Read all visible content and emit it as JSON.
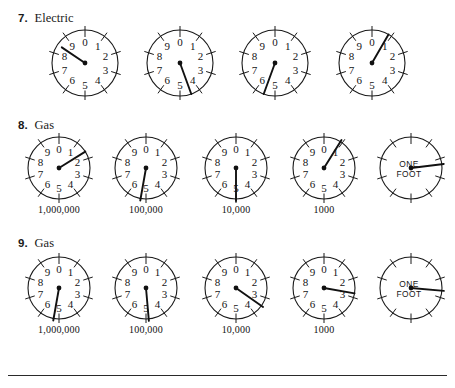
{
  "page": {
    "width": 455,
    "height": 388,
    "background": "#ffffff",
    "ink": "#1a1a1a"
  },
  "sections": [
    {
      "number": "7.",
      "label": "Electric",
      "head_x": 18,
      "head_y": 12,
      "row_top": 26,
      "dial_radius": 33,
      "show_captions": false,
      "has_one_foot": false,
      "dials": [
        {
          "name": "electric-dial-1",
          "cx": 85,
          "direction": "ccw",
          "digits": [
            "0",
            "9",
            "8",
            "7",
            "6",
            "5",
            "4",
            "3",
            "2",
            "1"
          ],
          "needle_angle": -56,
          "needle_len": 28,
          "caption": ""
        },
        {
          "name": "electric-dial-2",
          "cx": 180,
          "direction": "cw",
          "digits": [
            "0",
            "1",
            "2",
            "3",
            "4",
            "5",
            "6",
            "7",
            "8",
            "9"
          ],
          "needle_angle": 160,
          "needle_len": 33,
          "caption": ""
        },
        {
          "name": "electric-dial-3",
          "cx": 275,
          "direction": "ccw",
          "digits": [
            "0",
            "9",
            "8",
            "7",
            "6",
            "5",
            "4",
            "3",
            "2",
            "1"
          ],
          "needle_angle": -160,
          "needle_len": 33,
          "caption": ""
        },
        {
          "name": "electric-dial-4",
          "cx": 372,
          "direction": "cw",
          "digits": [
            "0",
            "1",
            "2",
            "3",
            "4",
            "5",
            "6",
            "7",
            "8",
            "9"
          ],
          "needle_angle": 30,
          "needle_len": 33,
          "caption": ""
        }
      ]
    },
    {
      "number": "8.",
      "label": "Gas",
      "head_x": 18,
      "head_y": 119,
      "row_top": 133,
      "dial_radius": 31,
      "show_captions": true,
      "has_one_foot": true,
      "dials": [
        {
          "name": "gas8-dial-1000000",
          "cx": 59,
          "direction": "ccw",
          "digits": [
            "0",
            "9",
            "8",
            "7",
            "6",
            "5",
            "4",
            "3",
            "2",
            "1"
          ],
          "needle_angle": 58,
          "needle_len": 31,
          "caption": "1,000,000"
        },
        {
          "name": "gas8-dial-100000",
          "cx": 146,
          "direction": "cw",
          "digits": [
            "0",
            "1",
            "2",
            "3",
            "4",
            "5",
            "6",
            "7",
            "8",
            "9"
          ],
          "needle_angle": 190,
          "needle_len": 33,
          "caption": "100,000"
        },
        {
          "name": "gas8-dial-10000",
          "cx": 236,
          "direction": "ccw",
          "digits": [
            "0",
            "9",
            "8",
            "7",
            "6",
            "5",
            "4",
            "3",
            "2",
            "1"
          ],
          "needle_angle": 180,
          "needle_len": 33,
          "caption": "10,000"
        },
        {
          "name": "gas8-dial-1000",
          "cx": 324,
          "direction": "cw",
          "digits": [
            "0",
            "1",
            "2",
            "3",
            "4",
            "5",
            "6",
            "7",
            "8",
            "9"
          ],
          "needle_angle": 32,
          "needle_len": 33,
          "caption": "1000"
        },
        {
          "name": "gas8-dial-one-foot",
          "cx": 411,
          "direction": "cw",
          "digits": [],
          "needle_angle": 83,
          "needle_len": 33,
          "caption": "",
          "one_foot_line1": "ONE",
          "one_foot_line2": "FOOT"
        }
      ]
    },
    {
      "number": "9.",
      "label": "Gas",
      "head_x": 18,
      "head_y": 237,
      "row_top": 253,
      "dial_radius": 31,
      "show_captions": true,
      "has_one_foot": true,
      "dials": [
        {
          "name": "gas9-dial-1000000",
          "cx": 59,
          "direction": "ccw",
          "digits": [
            "0",
            "9",
            "8",
            "7",
            "6",
            "5",
            "4",
            "3",
            "2",
            "1"
          ],
          "needle_angle": -170,
          "needle_len": 33,
          "caption": "1,000,000"
        },
        {
          "name": "gas9-dial-100000",
          "cx": 146,
          "direction": "cw",
          "digits": [
            "0",
            "1",
            "2",
            "3",
            "4",
            "5",
            "6",
            "7",
            "8",
            "9"
          ],
          "needle_angle": 175,
          "needle_len": 33,
          "caption": "100,000"
        },
        {
          "name": "gas9-dial-10000",
          "cx": 236,
          "direction": "ccw",
          "digits": [
            "0",
            "9",
            "8",
            "7",
            "6",
            "5",
            "4",
            "3",
            "2",
            "1"
          ],
          "needle_angle": 125,
          "needle_len": 33,
          "caption": "10,000"
        },
        {
          "name": "gas9-dial-1000",
          "cx": 324,
          "direction": "cw",
          "digits": [
            "0",
            "1",
            "2",
            "3",
            "4",
            "5",
            "6",
            "7",
            "8",
            "9"
          ],
          "needle_angle": 100,
          "needle_len": 31,
          "caption": "1000"
        },
        {
          "name": "gas9-dial-one-foot",
          "cx": 411,
          "direction": "cw",
          "digits": [],
          "needle_angle": 95,
          "needle_len": 33,
          "caption": "",
          "one_foot_line1": "ONE",
          "one_foot_line2": "FOOT"
        }
      ]
    }
  ],
  "footer_rule": true
}
